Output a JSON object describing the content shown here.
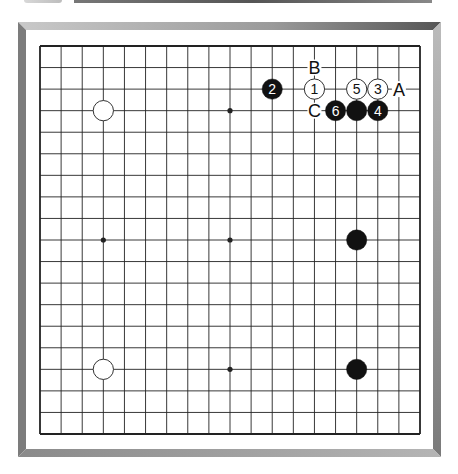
{
  "board": {
    "size": 19,
    "star_points": [
      [
        3,
        3
      ],
      [
        3,
        9
      ],
      [
        3,
        15
      ],
      [
        9,
        3
      ],
      [
        9,
        9
      ],
      [
        9,
        15
      ],
      [
        15,
        3
      ],
      [
        15,
        9
      ],
      [
        15,
        15
      ]
    ],
    "stones": [
      {
        "color": "white",
        "col": 3,
        "row": 3,
        "label": ""
      },
      {
        "color": "white",
        "col": 3,
        "row": 15,
        "label": ""
      },
      {
        "color": "black",
        "col": 15,
        "row": 9,
        "label": ""
      },
      {
        "color": "black",
        "col": 15,
        "row": 15,
        "label": ""
      },
      {
        "color": "white",
        "col": 13,
        "row": 2,
        "label": "1"
      },
      {
        "color": "black",
        "col": 11,
        "row": 2,
        "label": "2"
      },
      {
        "color": "white",
        "col": 16,
        "row": 2,
        "label": "3"
      },
      {
        "color": "black",
        "col": 16,
        "row": 3,
        "label": "4"
      },
      {
        "color": "white",
        "col": 15,
        "row": 2,
        "label": "5"
      },
      {
        "color": "black",
        "col": 14,
        "row": 3,
        "label": "6"
      },
      {
        "color": "black",
        "col": 15,
        "row": 3,
        "label": ""
      }
    ],
    "markers": [
      {
        "col": 13,
        "row": 1,
        "label": "B"
      },
      {
        "col": 17,
        "row": 2,
        "label": "A"
      },
      {
        "col": 13,
        "row": 3,
        "label": "C"
      }
    ]
  },
  "colors": {
    "line": "#222222",
    "black_stone": "#111111",
    "white_stone": "#ffffff"
  }
}
